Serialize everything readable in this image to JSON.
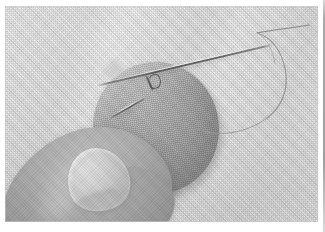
{
  "page": {
    "kind": "printed-photograph",
    "background_color": "#ffffff",
    "caption": ""
  },
  "photo": {
    "alt": "Close-up grayscale photograph of a thumb holding a round fabric patch on white cloth while a long sewing needle and thread pass through it",
    "subject": "hand-sewing a circular fabric patch",
    "tone": "grayscale halftone print",
    "colors": {
      "cloth_background": "#f3f3f3",
      "fabric_patch": "#b8b8b8",
      "skin_thumb": "#a8a8a8",
      "fingernail": "#d8d8d8",
      "needle_metal": "#5e5e5e",
      "thread": "#8a8a8a",
      "page_edge_rule": "#8f8f8f"
    },
    "elements": {
      "background_cloth": "white woven cloth with diagonal folds",
      "fabric_patch": "round gray fabric circle, centered",
      "thumb": "thumb with fingernail pressing the patch from lower left",
      "long_needle": "long straight sewing needle crossing the upper area diagonally",
      "thread": "thin thread from the needle eye curving down and to the right",
      "pin": "short pin pushed through the patch",
      "thread_loop": "small loop of thread at the stitch point",
      "page_edge": "dark vertical rule at the right margin"
    }
  }
}
